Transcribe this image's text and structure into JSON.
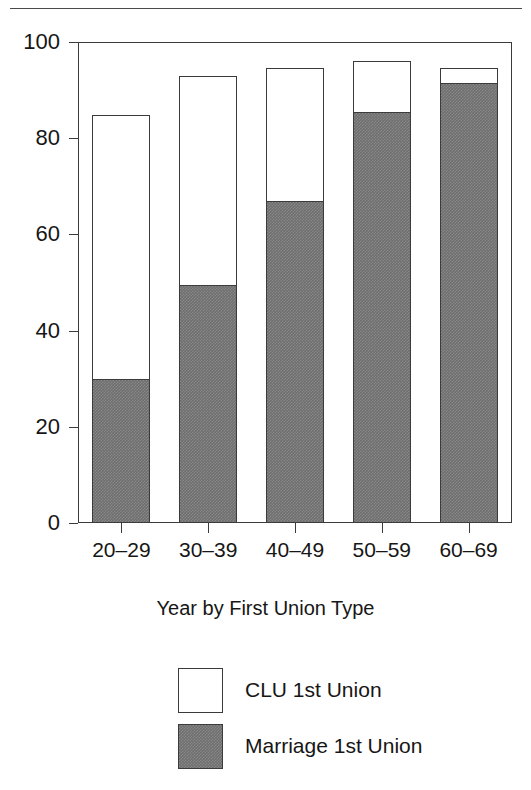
{
  "page": {
    "top_rule_clipped_text": "g,"
  },
  "chart_data": {
    "type": "bar",
    "stacked": true,
    "title": "",
    "subtitle": "",
    "xlabel": "Year by First Union Type",
    "ylabel": "",
    "categories": [
      "20–29",
      "30–39",
      "40–49",
      "50–59",
      "60–69"
    ],
    "series": [
      {
        "name": "Marriage 1st Union",
        "color": "#6e6e6e",
        "fill": "gray-hatch",
        "values": [
          30,
          49.5,
          67,
          85.5,
          91.5
        ]
      },
      {
        "name": "CLU 1st Union",
        "color": "#ffffff",
        "fill": "white",
        "values": [
          54.8,
          43.5,
          27.5,
          10.5,
          3
        ]
      }
    ],
    "totals": [
      84.8,
      93,
      94.5,
      96,
      94.5
    ],
    "ylim": [
      0,
      100
    ],
    "yticks": [
      0,
      20,
      40,
      60,
      80,
      100
    ],
    "ytick_labels": [
      "0",
      "20",
      "40",
      "60",
      "80",
      "100"
    ],
    "grid": false,
    "legend_position": "bottom",
    "legend_entries": [
      {
        "label": "CLU 1st Union",
        "swatch": "open"
      },
      {
        "label": "Marriage 1st Union",
        "swatch": "filled"
      }
    ]
  },
  "colors": {
    "axis": "#3b3b3b",
    "marriage": "#6e6e6e",
    "clu": "#ffffff",
    "text": "#161616"
  }
}
